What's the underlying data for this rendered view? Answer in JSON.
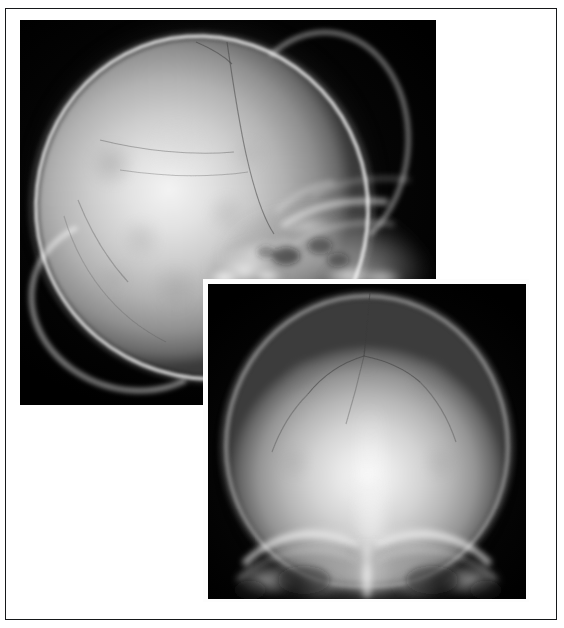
{
  "figure": {
    "domain": "medical-radiograph",
    "modality": "Plain film radiography (X-ray)",
    "anatomy": "Skull",
    "panel_count": 2,
    "caption": "",
    "background_color": "#ffffff",
    "frame_color": "#16181a",
    "film_background_color": "#000000",
    "bone_highlight_color": "#f3f3f3"
  },
  "panels": [
    {
      "id": "panel-lateral",
      "label": "",
      "view": "Lateral skull radiograph",
      "position": "top-left",
      "rect": {
        "x": 20,
        "y": 20,
        "width": 416,
        "height": 385
      },
      "description": "Lateral projection of the cranium showing the calvarium, coronal and lambdoid sutures, and the dense skull base with petrous and mastoid structures inferiorly.",
      "features": [
        "cranial vault",
        "inner and outer table of skull",
        "diploic space",
        "coronal suture",
        "lambdoid suture",
        "vascular grooves",
        "occipital bone",
        "frontal bone",
        "skull base",
        "petrous ridge",
        "mastoid air cells",
        "sella turcica region",
        "facial bones"
      ]
    },
    {
      "id": "panel-ap",
      "label": "",
      "view": "Anteroposterior (AP) skull radiograph",
      "position": "bottom-right (overlapping inset)",
      "rect": {
        "x": 208,
        "y": 284,
        "width": 318,
        "height": 315
      },
      "matte_rect": {
        "x": 203,
        "y": 279,
        "width": 326,
        "height": 323
      },
      "description": "Frontal projection of the cranium showing the symmetric calvarium, sagittal and coronal sutures, orbital roofs and petrous ridges at the skull base.",
      "features": [
        "cranial vault",
        "sagittal suture",
        "coronal suture",
        "lambdoid suture",
        "midline septum",
        "orbital roof",
        "petrous ridge",
        "superior orbital margin",
        "sphenoid wing",
        "mastoid region"
      ]
    }
  ],
  "lateral_sutures": [
    {
      "name": "coronal-suture",
      "d": "M 207 22 C 212 56 218 98 226 134 C 234 170 242 196 254 214"
    },
    {
      "name": "sagittal-suture-projection",
      "d": "M 176 22 C 190 28 202 34 212 44"
    },
    {
      "name": "vascular-groove-upper",
      "d": "M 80 120 C 120 130 170 136 214 132"
    },
    {
      "name": "vascular-groove-mid",
      "d": "M 100 150 C 140 156 186 158 228 152"
    },
    {
      "name": "lambdoid-suture",
      "d": "M 58 180 C 70 210 86 238 108 262"
    },
    {
      "name": "inner-table-shadow",
      "d": "M 44 196 C 60 250 94 296 146 322"
    }
  ],
  "ap_sutures": [
    {
      "name": "sagittal-suture",
      "d": "M 162 8 C 160 34 158 54 156 72"
    },
    {
      "name": "coronal-suture-left",
      "d": "M 156 72 C 136 78 116 90 100 110"
    },
    {
      "name": "coronal-suture-right",
      "d": "M 156 72 C 176 76 196 84 212 98"
    },
    {
      "name": "lambdoid-left",
      "d": "M 100 110 C 84 126 72 146 64 168"
    },
    {
      "name": "lambdoid-right",
      "d": "M 212 98 C 228 114 240 134 248 158"
    },
    {
      "name": "accessory-suture",
      "d": "M 156 72 C 150 98 144 120 138 140"
    }
  ],
  "lateral_base_structures": [
    {
      "name": "petrous-ridge",
      "cx": 236,
      "cy": 234,
      "rx": 54,
      "ry": 18,
      "rot": -14,
      "opacity": 0.62
    },
    {
      "name": "sella-floor",
      "cx": 288,
      "cy": 206,
      "rx": 30,
      "ry": 11,
      "rot": -6,
      "opacity": 0.55
    },
    {
      "name": "mastoid-dense",
      "cx": 224,
      "cy": 250,
      "rx": 40,
      "ry": 16,
      "rot": -8,
      "opacity": 0.78
    },
    {
      "name": "facial-bone-dense",
      "cx": 330,
      "cy": 250,
      "rx": 46,
      "ry": 20,
      "rot": 6,
      "opacity": 0.4
    },
    {
      "name": "orbital-roof",
      "cx": 310,
      "cy": 190,
      "rx": 42,
      "ry": 14,
      "rot": -20,
      "opacity": 0.46
    },
    {
      "name": "clivus",
      "cx": 268,
      "cy": 222,
      "rx": 24,
      "ry": 10,
      "rot": 10,
      "opacity": 0.45
    }
  ],
  "ap_base_structures": [
    {
      "name": "orbital-roof-left",
      "cx": 100,
      "cy": 268,
      "rx": 52,
      "ry": 22,
      "rot": -10,
      "opacity": 0.58
    },
    {
      "name": "orbital-roof-right",
      "cx": 216,
      "cy": 268,
      "rx": 52,
      "ry": 22,
      "rot": 10,
      "opacity": 0.58
    },
    {
      "name": "petrous-ridge-left",
      "cx": 86,
      "cy": 288,
      "rx": 48,
      "ry": 16,
      "rot": -8,
      "opacity": 0.5
    },
    {
      "name": "petrous-ridge-right",
      "cx": 230,
      "cy": 288,
      "rx": 48,
      "ry": 16,
      "rot": 8,
      "opacity": 0.5
    },
    {
      "name": "nasal-septum",
      "cx": 160,
      "cy": 292,
      "rx": 10,
      "ry": 24,
      "rot": 0,
      "opacity": 0.55
    },
    {
      "name": "ethmoid-region",
      "cx": 160,
      "cy": 272,
      "rx": 26,
      "ry": 14,
      "rot": 0,
      "opacity": 0.38
    }
  ]
}
